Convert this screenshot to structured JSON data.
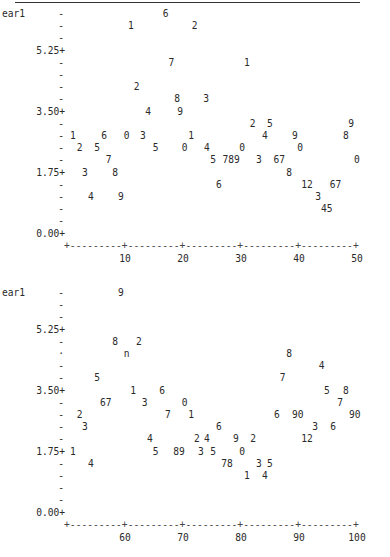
{
  "chart_data": [
    {
      "type": "scatter",
      "title": "",
      "ylabel": "ear1",
      "xlabel": "",
      "ylim": [
        0,
        6.3
      ],
      "xlim": [
        0,
        50
      ],
      "yticks": [
        "5.25",
        "3.50",
        "1.75",
        "0.00"
      ],
      "xticks": [
        "10",
        "20",
        "30",
        "40",
        "50"
      ],
      "plot_symbols_note": "Points plotted as digit labels (SAS-style text plot)",
      "points": [
        {
          "label": "6",
          "x": 17,
          "y": 6.3
        },
        {
          "label": "1",
          "x": 11,
          "y": 5.95
        },
        {
          "label": "2",
          "x": 22,
          "y": 5.95
        },
        {
          "label": "7",
          "x": 18,
          "y": 4.9
        },
        {
          "label": "1",
          "x": 31,
          "y": 4.9
        },
        {
          "label": "2",
          "x": 12,
          "y": 4.2
        },
        {
          "label": "8",
          "x": 19,
          "y": 3.85
        },
        {
          "label": "3",
          "x": 24,
          "y": 3.85
        },
        {
          "label": "4",
          "x": 14,
          "y": 3.5
        },
        {
          "label": "9",
          "x": 20,
          "y": 3.5
        },
        {
          "label": "2",
          "x": 32,
          "y": 3.15
        },
        {
          "label": "5",
          "x": 35,
          "y": 3.15
        },
        {
          "label": "9",
          "x": 49,
          "y": 3.15
        },
        {
          "label": "1",
          "x": 1,
          "y": 2.8
        },
        {
          "label": "6",
          "x": 6,
          "y": 2.8
        },
        {
          "label": "0",
          "x": 10,
          "y": 2.8
        },
        {
          "label": "3",
          "x": 13,
          "y": 2.8
        },
        {
          "label": "1",
          "x": 21,
          "y": 2.8
        },
        {
          "label": "4",
          "x": 34,
          "y": 2.8
        },
        {
          "label": "9",
          "x": 39,
          "y": 2.8
        },
        {
          "label": "8",
          "x": 48,
          "y": 2.8
        },
        {
          "label": "2",
          "x": 2,
          "y": 2.45
        },
        {
          "label": "5",
          "x": 5,
          "y": 2.45
        },
        {
          "label": "5",
          "x": 15,
          "y": 2.45
        },
        {
          "label": "0",
          "x": 20,
          "y": 2.45
        },
        {
          "label": "4",
          "x": 24,
          "y": 2.45
        },
        {
          "label": "0",
          "x": 30,
          "y": 2.45
        },
        {
          "label": "0",
          "x": 40,
          "y": 2.45
        },
        {
          "label": "7",
          "x": 7,
          "y": 2.1
        },
        {
          "label": "5",
          "x": 25,
          "y": 2.1
        },
        {
          "label": "7",
          "x": 27,
          "y": 2.1
        },
        {
          "label": "8",
          "x": 28,
          "y": 2.1
        },
        {
          "label": "9",
          "x": 29,
          "y": 2.1
        },
        {
          "label": "3",
          "x": 33,
          "y": 2.1
        },
        {
          "label": "6",
          "x": 36,
          "y": 2.1
        },
        {
          "label": "7",
          "x": 37,
          "y": 2.1
        },
        {
          "label": "0",
          "x": 50,
          "y": 2.1
        },
        {
          "label": "3",
          "x": 3,
          "y": 1.75
        },
        {
          "label": "8",
          "x": 8,
          "y": 1.75
        },
        {
          "label": "8",
          "x": 38,
          "y": 1.75
        },
        {
          "label": "6",
          "x": 26,
          "y": 1.4
        },
        {
          "label": "1",
          "x": 41,
          "y": 1.4
        },
        {
          "label": "2",
          "x": 42,
          "y": 1.4
        },
        {
          "label": "6",
          "x": 46,
          "y": 1.4
        },
        {
          "label": "7",
          "x": 47,
          "y": 1.4
        },
        {
          "label": "4",
          "x": 4,
          "y": 1.05
        },
        {
          "label": "9",
          "x": 9,
          "y": 1.05
        },
        {
          "label": "3",
          "x": 43,
          "y": 1.05
        },
        {
          "label": "4",
          "x": 44,
          "y": 0.7
        },
        {
          "label": "5",
          "x": 45,
          "y": 0.7
        }
      ]
    },
    {
      "type": "scatter",
      "title": "",
      "ylabel": "ear1",
      "xlabel": "",
      "ylim": [
        0,
        6.3
      ],
      "xlim": [
        50,
        100
      ],
      "yticks": [
        "5.25",
        "3.50",
        "1.75",
        "0.00"
      ],
      "xticks": [
        "60",
        "70",
        "80",
        "90",
        "100"
      ],
      "points": [
        {
          "label": "9",
          "x": 59,
          "y": 6.3
        },
        {
          "label": "8",
          "x": 58,
          "y": 4.9
        },
        {
          "label": "2",
          "x": 62,
          "y": 4.9
        },
        {
          "label": "n",
          "x": 60,
          "y": 4.55
        },
        {
          "label": "8",
          "x": 88,
          "y": 4.55
        },
        {
          "label": "4",
          "x": 94,
          "y": 4.2
        },
        {
          "label": "5",
          "x": 55,
          "y": 3.85
        },
        {
          "label": "7",
          "x": 87,
          "y": 3.85
        },
        {
          "label": "1",
          "x": 61,
          "y": 3.5
        },
        {
          "label": "6",
          "x": 66,
          "y": 3.5
        },
        {
          "label": "5",
          "x": 95,
          "y": 3.5
        },
        {
          "label": "8",
          "x": 98,
          "y": 3.5
        },
        {
          "label": "6",
          "x": 56,
          "y": 3.15
        },
        {
          "label": "7",
          "x": 57,
          "y": 3.15
        },
        {
          "label": "3",
          "x": 63,
          "y": 3.15
        },
        {
          "label": "0",
          "x": 70,
          "y": 3.15
        },
        {
          "label": "7",
          "x": 97,
          "y": 3.15
        },
        {
          "label": "2",
          "x": 52,
          "y": 2.8
        },
        {
          "label": "7",
          "x": 67,
          "y": 2.8
        },
        {
          "label": "1",
          "x": 71,
          "y": 2.8
        },
        {
          "label": "6",
          "x": 86,
          "y": 2.8
        },
        {
          "label": "9",
          "x": 89,
          "y": 2.8
        },
        {
          "label": "0",
          "x": 90,
          "y": 2.8
        },
        {
          "label": "9",
          "x": 99,
          "y": 2.8
        },
        {
          "label": "0",
          "x": 100,
          "y": 2.8
        },
        {
          "label": "3",
          "x": 53,
          "y": 2.45
        },
        {
          "label": "6",
          "x": 76,
          "y": 2.45
        },
        {
          "label": "3",
          "x": 93,
          "y": 2.45
        },
        {
          "label": "6",
          "x": 96,
          "y": 2.45
        },
        {
          "label": "4",
          "x": 64,
          "y": 2.1
        },
        {
          "label": "2",
          "x": 72,
          "y": 2.1
        },
        {
          "label": "4",
          "x": 74,
          "y": 2.1
        },
        {
          "label": "9",
          "x": 79,
          "y": 2.1
        },
        {
          "label": "2",
          "x": 82,
          "y": 2.1
        },
        {
          "label": "1",
          "x": 91,
          "y": 2.1
        },
        {
          "label": "2",
          "x": 92,
          "y": 2.1
        },
        {
          "label": "1",
          "x": 51,
          "y": 1.75
        },
        {
          "label": "5",
          "x": 65,
          "y": 1.75
        },
        {
          "label": "8",
          "x": 68,
          "y": 1.75
        },
        {
          "label": "9",
          "x": 69,
          "y": 1.75
        },
        {
          "label": "3",
          "x": 73,
          "y": 1.75
        },
        {
          "label": "5",
          "x": 75,
          "y": 1.75
        },
        {
          "label": "0",
          "x": 80,
          "y": 1.75
        },
        {
          "label": "4",
          "x": 54,
          "y": 1.4
        },
        {
          "label": "7",
          "x": 77,
          "y": 1.4
        },
        {
          "label": "8",
          "x": 78,
          "y": 1.4
        },
        {
          "label": "3",
          "x": 83,
          "y": 1.4
        },
        {
          "label": "5",
          "x": 85,
          "y": 1.4
        },
        {
          "label": "1",
          "x": 81,
          "y": 1.05
        },
        {
          "label": "4",
          "x": 84,
          "y": 1.05
        }
      ]
    }
  ],
  "plots": [
    {
      "ylabel": "ear1",
      "ytick_labels": [
        {
          "text": "5.25+",
          "row": 3
        },
        {
          "text": "3.50+",
          "row": 8
        },
        {
          "text": "1.75+",
          "row": 13
        },
        {
          "text": "0.00+",
          "row": 18
        }
      ],
      "minor_rows": [
        1,
        2,
        4,
        5,
        6,
        7,
        9,
        10,
        11,
        12,
        14,
        15,
        16,
        17
      ],
      "axis_line": "+---------+---------+---------+---------+---------+",
      "xtick_labels": [
        {
          "text": "10",
          "col": 10
        },
        {
          "text": "20",
          "col": 20
        },
        {
          "text": "30",
          "col": 30
        },
        {
          "text": "40",
          "col": 40
        },
        {
          "text": "50",
          "col": 50
        }
      ],
      "marks": [
        {
          "t": "6",
          "c": 17,
          "r": 0
        },
        {
          "t": "1",
          "c": 11,
          "r": 1
        },
        {
          "t": "2",
          "c": 22,
          "r": 1
        },
        {
          "t": "7",
          "c": 18,
          "r": 4
        },
        {
          "t": "1",
          "c": 31,
          "r": 4
        },
        {
          "t": "2",
          "c": 12,
          "r": 6
        },
        {
          "t": "8",
          "c": 19,
          "r": 7
        },
        {
          "t": "3",
          "c": 24,
          "r": 7
        },
        {
          "t": "4",
          "c": 14,
          "r": 8
        },
        {
          "t": "9",
          "c": 19.5,
          "r": 8
        },
        {
          "t": "2",
          "c": 32,
          "r": 9
        },
        {
          "t": "5",
          "c": 35,
          "r": 9
        },
        {
          "t": "9",
          "c": 49,
          "r": 9
        },
        {
          "t": "1",
          "c": 1,
          "r": 10
        },
        {
          "t": "6",
          "c": 6.4,
          "r": 10
        },
        {
          "t": "0",
          "c": 10.3,
          "r": 10
        },
        {
          "t": "3",
          "c": 13.1,
          "r": 10
        },
        {
          "t": "1",
          "c": 21.4,
          "r": 10
        },
        {
          "t": "4",
          "c": 34.1,
          "r": 10
        },
        {
          "t": "9",
          "c": 39.3,
          "r": 10
        },
        {
          "t": "8",
          "c": 48.1,
          "r": 10
        },
        {
          "t": "2",
          "c": 2.2,
          "r": 11
        },
        {
          "t": "5",
          "c": 5.2,
          "r": 11
        },
        {
          "t": "5",
          "c": 15.3,
          "r": 11
        },
        {
          "t": "0",
          "c": 20.3,
          "r": 11
        },
        {
          "t": "4",
          "c": 24.1,
          "r": 11
        },
        {
          "t": "0",
          "c": 30.2,
          "r": 11
        },
        {
          "t": "0",
          "c": 40.2,
          "r": 11
        },
        {
          "t": "7",
          "c": 7.2,
          "r": 12
        },
        {
          "t": "5",
          "c": 25.2,
          "r": 12
        },
        {
          "t": "789",
          "c": 28.3,
          "r": 12
        },
        {
          "t": "3",
          "c": 33.1,
          "r": 12
        },
        {
          "t": "67",
          "c": 36.6,
          "r": 12
        },
        {
          "t": "0",
          "c": 50,
          "r": 12
        },
        {
          "t": "3",
          "c": 3.1,
          "r": 13
        },
        {
          "t": "8",
          "c": 8.3,
          "r": 13
        },
        {
          "t": "8",
          "c": 38.3,
          "r": 13
        },
        {
          "t": "6",
          "c": 26.2,
          "r": 14
        },
        {
          "t": "12",
          "c": 41.4,
          "r": 14
        },
        {
          "t": "67",
          "c": 46.3,
          "r": 14
        },
        {
          "t": "4",
          "c": 4.1,
          "r": 15
        },
        {
          "t": "9",
          "c": 9.3,
          "r": 15
        },
        {
          "t": "3",
          "c": 43.3,
          "r": 15
        },
        {
          "t": "45",
          "c": 44.8,
          "r": 16
        }
      ]
    },
    {
      "ylabel": "ear1",
      "ytick_labels": [
        {
          "text": "5.25+",
          "row": 3
        },
        {
          "text": "3.50+",
          "row": 8
        },
        {
          "text": "1.75+",
          "row": 13
        },
        {
          "text": "0.00+",
          "row": 18
        }
      ],
      "minor_rows": [
        1,
        2,
        4,
        6,
        7,
        9,
        10,
        11,
        12,
        14,
        15,
        16,
        17
      ],
      "dot_rows": [
        5
      ],
      "axis_line": "+---------+---------+---------+---------+---------+",
      "xtick_labels": [
        {
          "text": "60",
          "col": 10
        },
        {
          "text": "70",
          "col": 20
        },
        {
          "text": "80",
          "col": 30
        },
        {
          "text": "90",
          "col": 40
        },
        {
          "text": "100",
          "col": 50
        }
      ],
      "marks": [
        {
          "t": "9",
          "c": 9.3,
          "r": 0
        },
        {
          "t": "8",
          "c": 8.3,
          "r": 4
        },
        {
          "t": "2",
          "c": 12.4,
          "r": 4
        },
        {
          "t": "n",
          "c": 10.3,
          "r": 5
        },
        {
          "t": "8",
          "c": 38.3,
          "r": 5
        },
        {
          "t": "4",
          "c": 43.9,
          "r": 6
        },
        {
          "t": "5",
          "c": 5.2,
          "r": 7
        },
        {
          "t": "7",
          "c": 37.2,
          "r": 7
        },
        {
          "t": "1",
          "c": 11.4,
          "r": 8
        },
        {
          "t": "6",
          "c": 16.4,
          "r": 8
        },
        {
          "t": "5",
          "c": 44.8,
          "r": 8
        },
        {
          "t": "8",
          "c": 48.1,
          "r": 8
        },
        {
          "t": "67",
          "c": 6.7,
          "r": 9
        },
        {
          "t": "3",
          "c": 13.4,
          "r": 9
        },
        {
          "t": "0",
          "c": 20.3,
          "r": 9
        },
        {
          "t": "7",
          "c": 47.1,
          "r": 9
        },
        {
          "t": "2",
          "c": 2.2,
          "r": 10
        },
        {
          "t": "7",
          "c": 17.4,
          "r": 10
        },
        {
          "t": "1",
          "c": 21.4,
          "r": 10
        },
        {
          "t": "6",
          "c": 36.2,
          "r": 10
        },
        {
          "t": "90",
          "c": 39.8,
          "r": 10
        },
        {
          "t": "90",
          "c": 49.6,
          "r": 10
        },
        {
          "t": "3",
          "c": 3.1,
          "r": 11
        },
        {
          "t": "6",
          "c": 26.2,
          "r": 11
        },
        {
          "t": "3",
          "c": 42.8,
          "r": 11
        },
        {
          "t": "6",
          "c": 45.9,
          "r": 11
        },
        {
          "t": "4",
          "c": 14.3,
          "r": 12
        },
        {
          "t": "2",
          "c": 22.4,
          "r": 12
        },
        {
          "t": "4",
          "c": 24.1,
          "r": 12
        },
        {
          "t": "9",
          "c": 29.1,
          "r": 12
        },
        {
          "t": "2",
          "c": 32.1,
          "r": 12
        },
        {
          "t": "12",
          "c": 41.4,
          "r": 12
        },
        {
          "t": "1",
          "c": 1,
          "r": 13
        },
        {
          "t": "5",
          "c": 15.3,
          "r": 13
        },
        {
          "t": "89",
          "c": 19.3,
          "r": 13
        },
        {
          "t": "3",
          "c": 23.1,
          "r": 13
        },
        {
          "t": "5",
          "c": 25.2,
          "r": 13
        },
        {
          "t": "0",
          "c": 30.2,
          "r": 13
        },
        {
          "t": "4",
          "c": 4.1,
          "r": 14
        },
        {
          "t": "78",
          "c": 27.6,
          "r": 14
        },
        {
          "t": "3",
          "c": 33.1,
          "r": 14
        },
        {
          "t": "5",
          "c": 35,
          "r": 14
        },
        {
          "t": "1",
          "c": 31,
          "r": 15
        },
        {
          "t": "4",
          "c": 34.1,
          "r": 15
        }
      ]
    }
  ],
  "layout": {
    "plot_tops": [
      14,
      293
    ]
  }
}
